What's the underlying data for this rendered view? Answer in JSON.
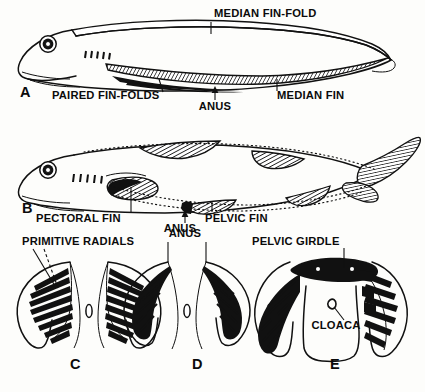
{
  "figure": {
    "background_color": "#fdfdfb",
    "ink_color": "#111111"
  },
  "panels": [
    {
      "id": "A",
      "letter": "A",
      "caption": "hypothetical ancestral vertebrate with continuous median and paired fin-folds",
      "letter_x": 20,
      "letter_y": 97
    },
    {
      "id": "B",
      "letter": "B",
      "caption": "shark-like fish with discrete paired fins",
      "letter_x": 22,
      "letter_y": 212
    },
    {
      "id": "C",
      "letter": "C",
      "caption": "ventral view, primitive continuous radials",
      "letter_x": 70,
      "letter_y": 368
    },
    {
      "id": "D",
      "letter": "D",
      "caption": "ventral view, radials concentrated",
      "letter_x": 192,
      "letter_y": 368
    },
    {
      "id": "E",
      "letter": "E",
      "caption": "ventral view, pelvic girdle and cloaca formed",
      "letter_x": 330,
      "letter_y": 368
    }
  ],
  "labels": [
    {
      "key": "median_fin_fold",
      "text": "MEDIAN FIN-FOLD",
      "x": 214,
      "y": 17,
      "anchor": "start",
      "panel": "A"
    },
    {
      "key": "paired_fin_folds",
      "text": "PAIRED FIN-FOLDS",
      "x": 52,
      "y": 99,
      "anchor": "start",
      "panel": "A"
    },
    {
      "key": "anus_a",
      "text": "ANUS",
      "x": 215,
      "y": 108,
      "anchor": "middle",
      "panel": "A"
    },
    {
      "key": "median_fin",
      "text": "MEDIAN FIN",
      "x": 277,
      "y": 99,
      "anchor": "start",
      "panel": "A"
    },
    {
      "key": "pectoral_fin",
      "text": "PECTORAL FIN",
      "x": 36,
      "y": 220,
      "anchor": "start",
      "panel": "B"
    },
    {
      "key": "anus_b",
      "text": "ANUS",
      "x": 180,
      "y": 231,
      "anchor": "middle",
      "panel": "B"
    },
    {
      "key": "pelvic_fin",
      "text": "PELVIC FIN",
      "x": 205,
      "y": 220,
      "anchor": "start",
      "panel": "B"
    },
    {
      "key": "primitive_radials",
      "text": "PRIMITIVE RADIALS",
      "x": 22,
      "y": 245,
      "anchor": "start",
      "panel": "C"
    },
    {
      "key": "anus_d",
      "text": "ANUS",
      "x": 185,
      "y": 236,
      "anchor": "middle",
      "panel": "D"
    },
    {
      "key": "pelvic_girdle",
      "text": "PELVIC GIRDLE",
      "x": 252,
      "y": 245,
      "anchor": "start",
      "panel": "E"
    },
    {
      "key": "cloaca",
      "text": "CLOACA",
      "x": 336,
      "y": 327,
      "anchor": "middle",
      "panel": "E"
    }
  ],
  "anatomy": {
    "panel_a_features": [
      "median fin-fold",
      "paired fin-folds",
      "anus",
      "median fin",
      "eye",
      "gill slits",
      "mouth"
    ],
    "panel_b_features": [
      "pectoral fin",
      "pelvic fin",
      "anus",
      "dorsal fins",
      "anal fin",
      "heterocercal tail",
      "eye",
      "gill slits"
    ],
    "panel_c_features": [
      "primitive radials",
      "paired fin-folds",
      "anus"
    ],
    "panel_d_features": [
      "concentrated radials",
      "anus"
    ],
    "panel_e_features": [
      "pelvic girdle",
      "cloaca",
      "jointed radials"
    ],
    "gill_slit_count": 5
  }
}
